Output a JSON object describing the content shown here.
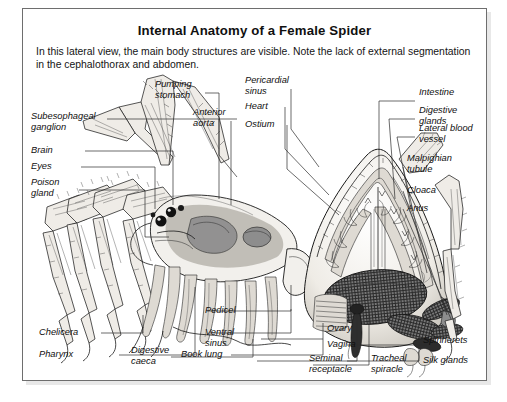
{
  "figure": {
    "title": "Internal Anatomy of a Female Spider",
    "caption": "In this lateral view, the main body structures are visible. Note the lack of external segmentation in the cephalothorax and abdomen.",
    "view": "lateral",
    "subject": "female spider",
    "style": "black-and-white engraved line drawing with stipple shading"
  },
  "labels": {
    "left": [
      {
        "id": "subesophageal-ganglion",
        "text": "Subesophageal\nganglion"
      },
      {
        "id": "brain",
        "text": "Brain"
      },
      {
        "id": "eyes",
        "text": "Eyes"
      },
      {
        "id": "poison-gland",
        "text": "Poison\ngland"
      },
      {
        "id": "chelicera",
        "text": "Chelicera"
      },
      {
        "id": "pharynx",
        "text": "Pharynx"
      }
    ],
    "top": [
      {
        "id": "pumping-stomach",
        "text": "Pumping\nstomach"
      },
      {
        "id": "anterior-aorta",
        "text": "Anterior\naorta"
      },
      {
        "id": "pericardial-sinus",
        "text": "Pericardial\nsinus"
      },
      {
        "id": "heart",
        "text": "Heart"
      },
      {
        "id": "ostium",
        "text": "Ostium"
      }
    ],
    "right": [
      {
        "id": "intestine",
        "text": "Intestine"
      },
      {
        "id": "digestive-glands",
        "text": "Digestive glands"
      },
      {
        "id": "lateral-blood-vessel",
        "text": "Lateral blood vessel"
      },
      {
        "id": "malpighian-tubule",
        "text": "Malpighian\ntubule"
      },
      {
        "id": "cloaca",
        "text": "Cloaca"
      },
      {
        "id": "anus",
        "text": "Anus"
      }
    ],
    "bottom": [
      {
        "id": "digestive-caeca",
        "text": "Digestive\ncaeca"
      },
      {
        "id": "pedicel",
        "text": "Pedicel"
      },
      {
        "id": "ventral-sinus",
        "text": "Ventral\nsinus"
      },
      {
        "id": "book-lung",
        "text": "Book lung"
      },
      {
        "id": "ovary",
        "text": "Ovary"
      },
      {
        "id": "vagina",
        "text": "Vagina"
      },
      {
        "id": "seminal-receptacle",
        "text": "Seminal\nreceptacle"
      },
      {
        "id": "tracheal-spiracle",
        "text": "Tracheal\nspiracle"
      },
      {
        "id": "spinnerets",
        "text": "Spinnerets"
      },
      {
        "id": "silk-glands",
        "text": "Silk glands"
      }
    ]
  },
  "colors": {
    "ink": "#1a1a1a",
    "frame": "#6e6e6e",
    "page": "#ffffff",
    "body_fill": "#f2f0ec",
    "dark_organ": "#2e2e2e",
    "mid_organ": "#8d8d8d"
  }
}
